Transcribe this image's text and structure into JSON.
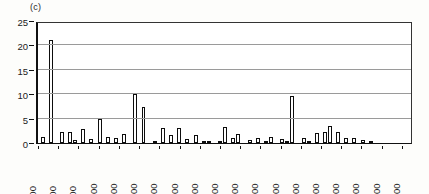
{
  "figure": {
    "panel_label": "(c)",
    "background": "#fdfdfb",
    "frame_color": "#111111",
    "bar_edge_color": "#0d0d0d",
    "bar_fill_color": "#ffffff",
    "gridline_color": "#9a9a9a"
  },
  "chart_data": {
    "type": "bar",
    "title": "(c)",
    "xlabel": "",
    "ylabel": "",
    "ylim": [
      0,
      25
    ],
    "yticks": [
      0,
      5,
      10,
      15,
      20,
      25
    ],
    "grid": true,
    "legend": "none",
    "orientation": "vertical",
    "xtick_labels": [
      "100",
      "300",
      "500",
      "1200",
      "2100",
      "3100",
      "4000",
      "4200",
      "4400",
      "5200",
      "5400",
      "6200",
      "6400",
      "7200",
      "8100",
      "8300",
      "8500",
      "9200",
      "9400"
    ],
    "xtick_positions": [
      0,
      5,
      10,
      15,
      20,
      25,
      30,
      35,
      40,
      45,
      50,
      55,
      60,
      65,
      70,
      75,
      80,
      85,
      90
    ],
    "categories": [
      "100",
      "150",
      "200",
      "250",
      "300",
      "350",
      "400",
      "450",
      "500",
      "550",
      "1200",
      "1250",
      "1300",
      "1350",
      "2100",
      "2150",
      "2200",
      "2250",
      "3100",
      "3150",
      "4000",
      "4050",
      "4100",
      "4150",
      "4200",
      "4250",
      "4300",
      "4350",
      "4400",
      "4450",
      "5200",
      "5250",
      "5300",
      "5350",
      "5400",
      "5450",
      "6200",
      "6250",
      "6300",
      "6350",
      "6400",
      "6450",
      "7200",
      "7250",
      "8100",
      "8150",
      "8200",
      "8250",
      "8300",
      "8350",
      "8500",
      "8550",
      "8600",
      "8650",
      "9200",
      "9250",
      "9400",
      "9450",
      "9500",
      "9550",
      "9600",
      "9650",
      "9700",
      "9750",
      "9800",
      "9850",
      "9900",
      "9950",
      "10000",
      "10050",
      "10100",
      "10150",
      "10200",
      "10250",
      "10300",
      "10350",
      "10400",
      "10450",
      "10500",
      "10550",
      "10600",
      "10650",
      "10700",
      "10750",
      "10800",
      "10850",
      "10900",
      "10950",
      "11000",
      "11050",
      "11100",
      "11150",
      "11200"
    ],
    "values": [
      1.3,
      0,
      21.2,
      0,
      0,
      2.2,
      0,
      2.2,
      0.6,
      0,
      2.8,
      0,
      0.9,
      0,
      5.0,
      0,
      1.2,
      0,
      1.0,
      0,
      1.9,
      0,
      0,
      10.0,
      0,
      7.3,
      0,
      0,
      0.2,
      0,
      3.1,
      0,
      1.7,
      0,
      3.0,
      0,
      0.8,
      0,
      1.6,
      0,
      0.5,
      0.4,
      0,
      0,
      0.3,
      3.2,
      0,
      1.0,
      1.9,
      0,
      0,
      0.6,
      0,
      1.0,
      0,
      0.4,
      1.2,
      0,
      0,
      0.8,
      0.4,
      9.7,
      0,
      0,
      1.0,
      0.3,
      0,
      2.0,
      0,
      2.2,
      3.4,
      0,
      2.3,
      0,
      1.0,
      0,
      1.0,
      0,
      0.7,
      0,
      0.1,
      0,
      0,
      0,
      0,
      0,
      0,
      0,
      0,
      0,
      0,
      0,
      0
    ],
    "max_value": 21.2,
    "n_bars": 93
  }
}
